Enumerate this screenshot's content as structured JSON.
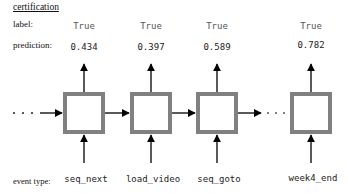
{
  "title": "certification",
  "rows": {
    "label": "label:",
    "prediction": "prediction:",
    "event_type": "event type:"
  },
  "steps": [
    {
      "label": "True",
      "prediction": "0.434",
      "event": "seq_next"
    },
    {
      "label": "True",
      "prediction": "0.397",
      "event": "load_video"
    },
    {
      "label": "True",
      "prediction": "0.589",
      "event": "seq_goto"
    },
    {
      "label": "True",
      "prediction": "0.782",
      "event": "week4_end"
    }
  ],
  "ellipsis": {
    "left": "· · ·",
    "middle": "· · ·"
  },
  "colors": {
    "box_border": "#808080",
    "arrow": "#000000",
    "text": "#111111"
  }
}
